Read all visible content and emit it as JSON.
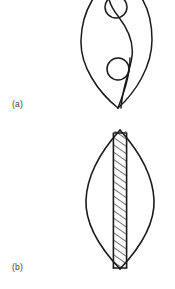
{
  "figure": {
    "background_color": "#ffffff",
    "stroke_color": "#1a1a1a",
    "label_color": "#3b3b3b",
    "panels": [
      {
        "id": "panel-a",
        "label": "(a)",
        "label_position": {
          "x": 12,
          "y": 99
        },
        "description": "lens (vesica) outline containing an S-shaped dividing curve and two small circles",
        "shape": {
          "type": "lens",
          "apex_top": {
            "x": 118,
            "y": -22
          },
          "apex_bottom": {
            "x": 118,
            "y": 108
          },
          "left_extreme": {
            "x": 81,
            "y": 36
          },
          "right_extreme": {
            "x": 152,
            "y": 36
          }
        },
        "elements": [
          {
            "name": "s-curve",
            "type": "path",
            "stroke_width": 1.4
          },
          {
            "name": "upper-circle",
            "cx": 116,
            "cy": 8,
            "r": 11,
            "stroke_width": 1.4
          },
          {
            "name": "lower-circle",
            "cx": 118,
            "cy": 69,
            "r": 11,
            "stroke_width": 1.4
          }
        ]
      },
      {
        "id": "panel-b",
        "label": "(b)",
        "label_position": {
          "x": 12,
          "y": 262
        },
        "description": "lens (vesica) outline with a vertical hatched band along the central axis",
        "shape": {
          "type": "lens",
          "apex_top": {
            "x": 120,
            "y": 130
          },
          "apex_bottom": {
            "x": 120,
            "y": 269
          },
          "left_extreme": {
            "x": 86,
            "y": 199
          },
          "right_extreme": {
            "x": 154,
            "y": 199
          }
        },
        "elements": [
          {
            "name": "hatched-band",
            "x_left": 113,
            "x_right": 127,
            "y_top": 131,
            "y_bottom": 268,
            "hatch_angle_deg": 45,
            "hatch_spacing": 6,
            "stroke_width": 1.4
          }
        ]
      }
    ]
  }
}
